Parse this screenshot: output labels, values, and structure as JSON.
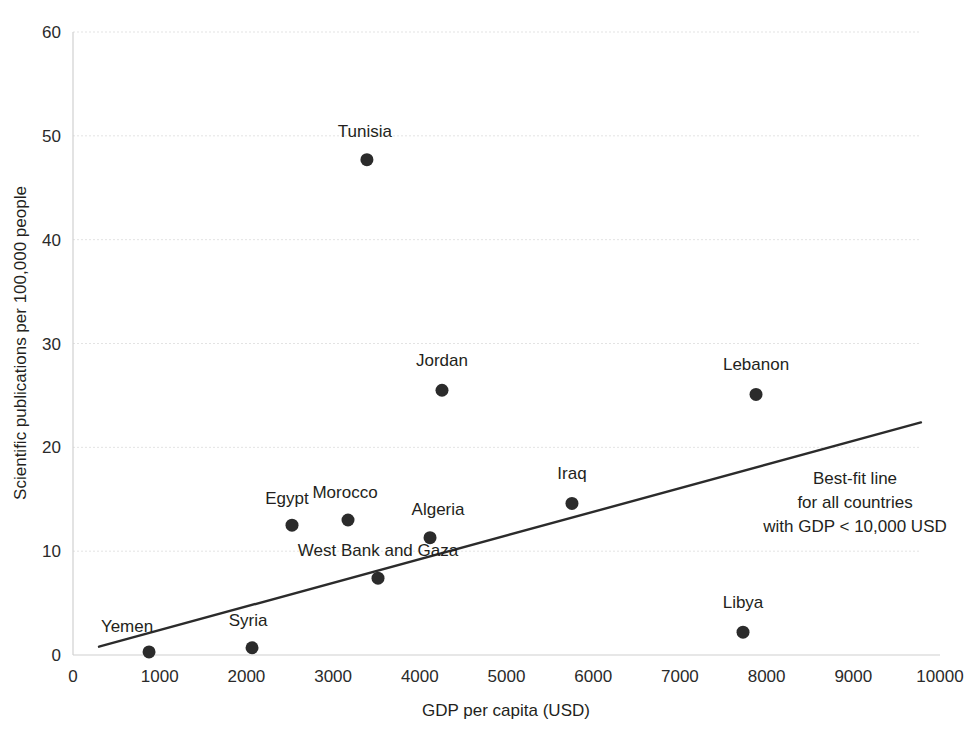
{
  "chart_data": {
    "type": "scatter",
    "title": "",
    "xlabel": "GDP per capita (USD)",
    "ylabel": "Scientific publications per 100,000 people",
    "xlim": [
      0,
      10000
    ],
    "ylim": [
      0,
      60
    ],
    "xticks": [
      "0",
      "1000",
      "2000",
      "3000",
      "4000",
      "5000",
      "6000",
      "7000",
      "8000",
      "9000",
      "10000"
    ],
    "yticks": [
      "0",
      "10",
      "20",
      "30",
      "40",
      "50",
      "60"
    ],
    "grid": "horizontal-dotted",
    "legend": "none",
    "points": [
      {
        "label": "Yemen",
        "x": 877,
        "y": 0.3,
        "label_dx": -22,
        "label_dy": -20
      },
      {
        "label": "Syria",
        "x": 2065,
        "y": 0.7,
        "label_dx": -4,
        "label_dy": -22
      },
      {
        "label": "Egypt",
        "x": 2526,
        "y": 12.5,
        "label_dx": -5,
        "label_dy": -21
      },
      {
        "label": "Morocco",
        "x": 3172,
        "y": 13.0,
        "label_dx": -3,
        "label_dy": -22
      },
      {
        "label": "Tunisia",
        "x": 3390,
        "y": 47.7,
        "label_dx": -2,
        "label_dy": -23
      },
      {
        "label": "West Bank and Gaza",
        "x": 3518,
        "y": 7.4,
        "label_dx": 0,
        "label_dy": -22
      },
      {
        "label": "Algeria",
        "x": 4118,
        "y": 11.3,
        "label_dx": 8,
        "label_dy": -23
      },
      {
        "label": "Jordan",
        "x": 4256,
        "y": 25.5,
        "label_dx": 0,
        "label_dy": -24
      },
      {
        "label": "Iraq",
        "x": 5755,
        "y": 14.6,
        "label_dx": 0,
        "label_dy": -24
      },
      {
        "label": "Libya",
        "x": 7728,
        "y": 2.2,
        "label_dx": 0,
        "label_dy": -24
      },
      {
        "label": "Lebanon",
        "x": 7878,
        "y": 25.1,
        "label_dx": 0,
        "label_dy": -24
      }
    ],
    "fit_line": {
      "x_start": 300,
      "y_start": 0.8,
      "x_end": 9780,
      "y_end": 22.4
    },
    "annotation": {
      "line1": "Best-fit line",
      "line2": "for all countries",
      "line3": "with GDP < 10,000 USD",
      "x": 9020,
      "y": 16.5
    },
    "colors": {
      "dot": "#2b2b2b",
      "fit_line": "#2b2b2b",
      "grid": "#e3e3e3",
      "text": "#231f20",
      "background": "#ffffff"
    }
  }
}
